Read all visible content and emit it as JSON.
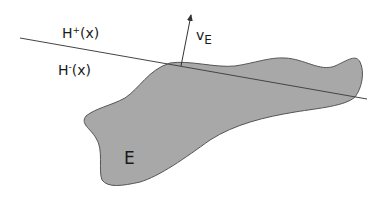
{
  "diagram": {
    "labels": {
      "upper_halfspace": "H",
      "upper_sup": "+",
      "upper_arg": "(x)",
      "lower_halfspace": "H",
      "lower_sup": "-",
      "lower_arg": "(x)",
      "normal_vector": "v",
      "normal_sub": "E",
      "region": "E"
    },
    "colors": {
      "region_fill": "#a8a8a8",
      "region_stroke": "#555555",
      "line": "#444444",
      "text": "#1a1a1a",
      "background": "#ffffff"
    }
  }
}
